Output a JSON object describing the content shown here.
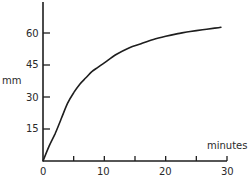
{
  "chart_data": {
    "type": "line",
    "title": "",
    "xlabel": "minutes",
    "ylabel": "mm",
    "xlim": [
      0,
      30
    ],
    "ylim": [
      0,
      68
    ],
    "x_ticks": [
      0,
      5,
      10,
      15,
      20,
      25,
      30
    ],
    "x_tick_labels": [
      "0",
      "",
      "10",
      "",
      "20",
      "",
      "30"
    ],
    "y_ticks": [
      15,
      30,
      45,
      60
    ],
    "y_tick_labels": [
      "15",
      "30",
      "45",
      "60"
    ],
    "grid": false,
    "legend": null,
    "series": [
      {
        "name": "curve",
        "x": [
          0,
          1,
          2,
          3,
          4,
          5,
          6,
          7,
          8,
          9,
          10,
          12,
          14,
          16,
          18,
          20,
          22,
          24,
          26,
          28,
          29
        ],
        "y": [
          0,
          7,
          13,
          20,
          27,
          32,
          36,
          39,
          42,
          44,
          46,
          50,
          53,
          55,
          57,
          58.5,
          59.7,
          60.7,
          61.5,
          62.3,
          62.7
        ]
      }
    ]
  },
  "labels": {
    "ylabel": "mm",
    "xlabel": "minutes",
    "origin": "0",
    "x10": "10",
    "x20": "20",
    "x30": "30",
    "y15": "15",
    "y30": "30",
    "y45": "45",
    "y60": "60"
  }
}
